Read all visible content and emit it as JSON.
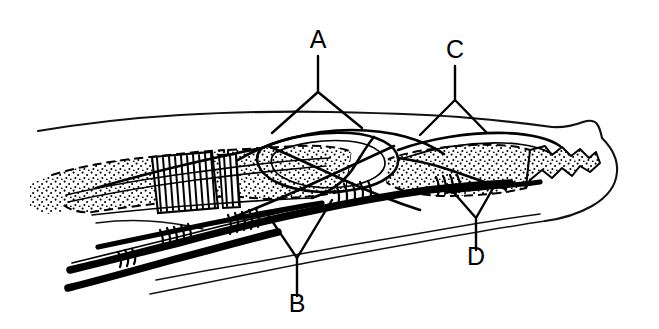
{
  "figure": {
    "background_color": "#ffffff",
    "ink_color": "#000000",
    "width": 659,
    "height": 329,
    "style": "black-and-white stippled line art"
  },
  "labels": [
    {
      "id": "A",
      "text": "A",
      "text_x": 318,
      "text_y": 48,
      "leader": {
        "stem_start": [
          318,
          56
        ],
        "stem_end": [
          318,
          92
        ],
        "fork_left_end": [
          272,
          133
        ],
        "fork_right_end": [
          362,
          128
        ]
      }
    },
    {
      "id": "C",
      "text": "C",
      "text_x": 455,
      "text_y": 58,
      "leader": {
        "stem_start": [
          455,
          66
        ],
        "stem_end": [
          455,
          100
        ],
        "fork_left_end": [
          420,
          135
        ],
        "fork_right_end": [
          487,
          133
        ]
      }
    },
    {
      "id": "B",
      "text": "B",
      "text_x": 297,
      "text_y": 312,
      "leader": {
        "stem_start": [
          297,
          296
        ],
        "stem_end": [
          297,
          258
        ],
        "fork_left_end": [
          266,
          212
        ],
        "fork_right_end": [
          332,
          200
        ]
      }
    },
    {
      "id": "D",
      "text": "D",
      "text_x": 476,
      "text_y": 265,
      "leader": {
        "stem_start": [
          476,
          250
        ],
        "stem_end": [
          476,
          218
        ],
        "fork_left_end": [
          448,
          186
        ],
        "fork_right_end": [
          496,
          183
        ]
      }
    }
  ],
  "structures": {
    "skin_dorsal": "dorsal skin surface contour running from proximal left to fingertip right",
    "skin_volar": "volar skin surface contour along the bottom",
    "fingertip": "rounded distal fingertip pulp at far right",
    "bone_proximal_phalanx": "stippled proximal phalanx shaft, left of centre",
    "bone_middle_phalanx": "stippled middle phalanx shaft, right of centre",
    "bone_distal_phalanx": "stippled distal phalanx with jagged tuft at far right",
    "pulley_hatched": "cross-hatched annular pulley over the proximal phalanx",
    "flexor_profundus_tendon": "deep thick black flexor digitorum profundus tendon",
    "flexor_superficialis_tendon": "superficial flexor digitorum superficialis tendon splitting and decussating over the proximal phalanx",
    "tendon_sheath": "thin outlined synovial tendon sheath envelope",
    "vincula": "short oblique vincular bands connecting tendons to bone"
  },
  "legend_note": ""
}
